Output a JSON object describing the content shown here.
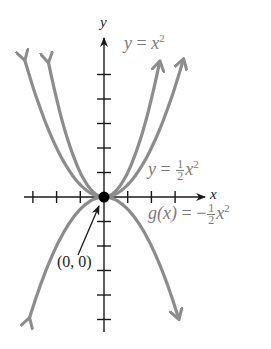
{
  "figure": {
    "axes": {
      "x_label": "x",
      "y_label": "y"
    },
    "origin_label": "(0, 0)",
    "curves": [
      {
        "name": "y = x^2",
        "label_lhs": "y",
        "label_eq": "=",
        "label_base": "x",
        "label_exp": "2",
        "coefficient": 1,
        "color": "#8c8c8c"
      },
      {
        "name": "y = 1/2 x^2",
        "label_lhs": "y",
        "label_eq": "=",
        "label_num": "1",
        "label_den": "2",
        "label_base": "x",
        "label_exp": "2",
        "coefficient": 0.5,
        "color": "#8c8c8c"
      },
      {
        "name": "g(x) = -1/2 x^2",
        "label_lhs": "g(x)",
        "label_eq": "=",
        "label_sign": "−",
        "label_num": "1",
        "label_den": "2",
        "label_base": "x",
        "label_exp": "2",
        "coefficient": -0.5,
        "color": "#8c8c8c"
      }
    ],
    "tick_spacing_units": 1,
    "x_ticks": [
      -3,
      -2,
      -1,
      1,
      2,
      3
    ],
    "y_ticks": [
      -5,
      -4,
      -3,
      -2,
      -1,
      1,
      2,
      3,
      4,
      5
    ],
    "vertex_point": {
      "x": 0,
      "y": 0,
      "color": "#000000"
    },
    "axis_color": "#1a1a1a"
  }
}
